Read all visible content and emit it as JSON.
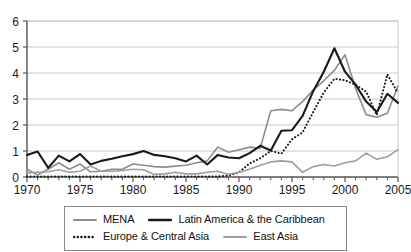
{
  "chart_data": {
    "type": "line",
    "title": "",
    "subtitle": "",
    "xlabel": "",
    "ylabel": "",
    "xlim": [
      1970,
      2005
    ],
    "ylim": [
      0,
      6
    ],
    "yticks": [
      0,
      1,
      2,
      3,
      4,
      5,
      6
    ],
    "xticks": [
      1970,
      1975,
      1980,
      1985,
      1990,
      1995,
      2000,
      2005
    ],
    "xtick_labels": [
      "1970",
      "1975",
      "1980",
      "1985",
      "1990",
      "1995",
      "2000",
      "2005"
    ],
    "ytick_labels": [
      "0",
      "1",
      "2",
      "3",
      "4",
      "5",
      "6"
    ],
    "minor_xticks_every": 1,
    "grid": "horizontal",
    "legend_position": "bottom",
    "x": [
      1970,
      1971,
      1972,
      1973,
      1974,
      1975,
      1976,
      1977,
      1978,
      1979,
      1980,
      1981,
      1982,
      1983,
      1984,
      1985,
      1986,
      1987,
      1988,
      1989,
      1990,
      1991,
      1992,
      1993,
      1994,
      1995,
      1996,
      1997,
      1998,
      1999,
      2000,
      2001,
      2002,
      2003,
      2004,
      2005
    ],
    "series": [
      {
        "name": "MENA",
        "color": "#8d8d8d",
        "style": "solid",
        "width": 1.6,
        "values": [
          0.3,
          0.08,
          0.3,
          0.55,
          0.3,
          0.5,
          0.2,
          0.22,
          0.3,
          0.3,
          0.5,
          0.45,
          0.4,
          0.38,
          0.42,
          0.45,
          0.55,
          0.62,
          1.15,
          0.95,
          1.05,
          1.15,
          1.1,
          2.55,
          2.6,
          2.55,
          2.9,
          3.35,
          3.7,
          4.1,
          4.7,
          3.4,
          2.4,
          2.3,
          2.45,
          3.5
        ]
      },
      {
        "name": "Latin America & the Caribbean",
        "color": "#1a1a1a",
        "style": "solid",
        "width": 2.1,
        "values": [
          0.85,
          0.98,
          0.35,
          0.82,
          0.6,
          0.88,
          0.48,
          0.62,
          0.7,
          0.8,
          0.88,
          1.0,
          0.85,
          0.8,
          0.72,
          0.6,
          0.82,
          0.48,
          0.85,
          0.75,
          0.72,
          0.92,
          1.2,
          1.02,
          1.78,
          1.8,
          2.35,
          3.3,
          4.05,
          4.95,
          4.05,
          3.55,
          2.9,
          2.5,
          3.2,
          2.85
        ]
      },
      {
        "name": "Europe & Central Asia",
        "color": "#1a1a1a",
        "style": "dotted",
        "width": 2.1,
        "values": [
          0.02,
          0.02,
          0.02,
          0.02,
          0.02,
          0.02,
          0.02,
          0.02,
          0.02,
          0.02,
          0.02,
          0.02,
          0.02,
          0.02,
          0.02,
          0.02,
          0.02,
          0.02,
          0.02,
          0.05,
          0.18,
          0.52,
          0.72,
          1.0,
          0.9,
          1.45,
          1.72,
          2.5,
          3.25,
          3.78,
          3.72,
          3.55,
          3.28,
          2.38,
          3.95,
          3.22
        ]
      },
      {
        "name": "East Asia",
        "color": "#9e9e9e",
        "style": "solid",
        "width": 1.6,
        "values": [
          0.16,
          0.18,
          0.2,
          0.28,
          0.18,
          0.22,
          0.42,
          0.22,
          0.22,
          0.25,
          0.3,
          0.28,
          0.1,
          0.12,
          0.18,
          0.12,
          0.12,
          0.18,
          0.22,
          0.1,
          0.18,
          0.3,
          0.45,
          0.58,
          0.62,
          0.58,
          0.18,
          0.4,
          0.48,
          0.42,
          0.55,
          0.62,
          0.92,
          0.68,
          0.78,
          1.05
        ]
      }
    ]
  },
  "legend": {
    "rows": [
      [
        {
          "label": "MENA",
          "series_index": 0
        },
        {
          "label": "Latin America & the Caribbean",
          "series_index": 1
        }
      ],
      [
        {
          "label": "Europe & Central Asia",
          "series_index": 2
        },
        {
          "label": "East Asia",
          "series_index": 3
        }
      ]
    ]
  },
  "colors": {
    "axis": "#555555",
    "grid": "#c8c8c8",
    "tick_text": "#1a1a1a",
    "background": "#ffffff",
    "legend_border": "#8a8a8a"
  }
}
